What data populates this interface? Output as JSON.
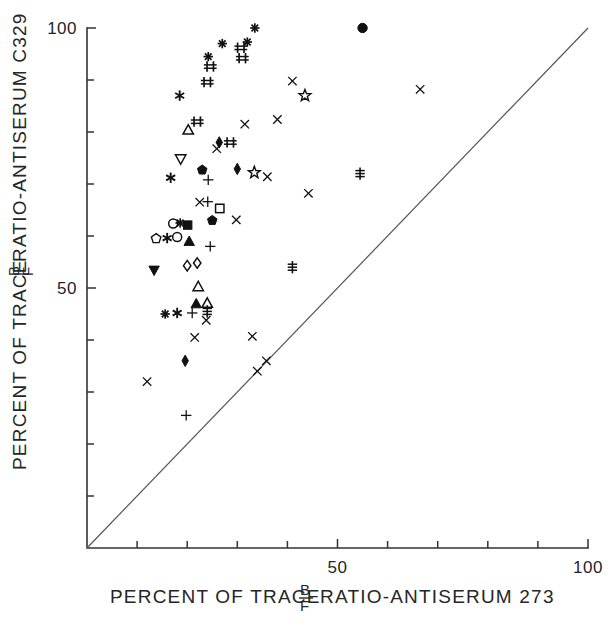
{
  "figure": {
    "width": 610,
    "height": 633,
    "background": "#ffffff",
    "ink_color": "#1a1a1a"
  },
  "chart_data": {
    "type": "scatter",
    "title": "",
    "subtitle": "",
    "xlabel_parts": {
      "prefix": "PERCENT OF TRACE",
      "fraction_numerator": "B",
      "fraction_denominator": "F",
      "suffix": "RATIO-ANTISERUM 273"
    },
    "ylabel_parts": {
      "prefix": "PERCENT OF TRACE",
      "fraction_numerator": "B",
      "fraction_denominator": "F",
      "suffix": "RATIO-ANTISERUM C329"
    },
    "xlabel": "PERCENT OF TRACE B/F RATIO-ANTISERUM 273",
    "ylabel": "PERCENT OF TRACE B/F RATIO-ANTISERUM C329",
    "xlim": [
      0,
      100
    ],
    "ylim": [
      0,
      100
    ],
    "xticks": [
      0,
      10,
      20,
      30,
      40,
      50,
      60,
      70,
      80,
      90,
      100
    ],
    "yticks": [
      0,
      10,
      20,
      30,
      40,
      50,
      60,
      70,
      80,
      90,
      100
    ],
    "xtick_labels": {
      "50": "50",
      "100": "100"
    },
    "ytick_labels": {
      "50": "50",
      "100": "100"
    },
    "grid": false,
    "legend": null,
    "reference_line": {
      "name": "identity-line",
      "from": [
        0,
        0
      ],
      "to": [
        100,
        100
      ],
      "style": "solid",
      "color": "#555555"
    },
    "marker_kinds": [
      "asterisk",
      "plus",
      "cross",
      "double-plus",
      "triple-bar",
      "open-circle",
      "filled-circle",
      "open-square",
      "filled-square",
      "open-triangle-up",
      "filled-triangle-up",
      "open-triangle-down",
      "filled-triangle-down",
      "open-diamond",
      "filled-diamond",
      "open-star",
      "filled-pentagon",
      "open-pentagon",
      "star-burst"
    ],
    "points": [
      {
        "x": 33.5,
        "y": 100.0,
        "marker": "asterisk"
      },
      {
        "x": 55.0,
        "y": 100.0,
        "marker": "filled-circle"
      },
      {
        "x": 27.0,
        "y": 97.0,
        "marker": "asterisk"
      },
      {
        "x": 32.0,
        "y": 97.3,
        "marker": "asterisk"
      },
      {
        "x": 30.7,
        "y": 96.2,
        "marker": "double-plus"
      },
      {
        "x": 24.2,
        "y": 94.5,
        "marker": "asterisk"
      },
      {
        "x": 31.0,
        "y": 94.2,
        "marker": "double-plus"
      },
      {
        "x": 24.6,
        "y": 92.6,
        "marker": "double-plus"
      },
      {
        "x": 24.0,
        "y": 89.6,
        "marker": "double-plus"
      },
      {
        "x": 18.5,
        "y": 87.0,
        "marker": "star-burst"
      },
      {
        "x": 41.0,
        "y": 89.8,
        "marker": "cross"
      },
      {
        "x": 43.5,
        "y": 87.0,
        "marker": "open-star"
      },
      {
        "x": 66.5,
        "y": 88.2,
        "marker": "cross"
      },
      {
        "x": 22.0,
        "y": 82.0,
        "marker": "double-plus"
      },
      {
        "x": 20.2,
        "y": 80.4,
        "marker": "open-triangle-up"
      },
      {
        "x": 31.5,
        "y": 81.5,
        "marker": "cross"
      },
      {
        "x": 38.0,
        "y": 82.4,
        "marker": "cross"
      },
      {
        "x": 26.4,
        "y": 78.0,
        "marker": "filled-diamond"
      },
      {
        "x": 28.6,
        "y": 78.0,
        "marker": "double-plus"
      },
      {
        "x": 25.9,
        "y": 76.8,
        "marker": "cross"
      },
      {
        "x": 18.7,
        "y": 74.8,
        "marker": "open-triangle-down"
      },
      {
        "x": 23.0,
        "y": 72.7,
        "marker": "filled-pentagon"
      },
      {
        "x": 30.0,
        "y": 72.9,
        "marker": "filled-diamond"
      },
      {
        "x": 33.4,
        "y": 72.2,
        "marker": "open-star"
      },
      {
        "x": 16.7,
        "y": 71.2,
        "marker": "star-burst"
      },
      {
        "x": 24.2,
        "y": 70.8,
        "marker": "plus"
      },
      {
        "x": 36.0,
        "y": 71.4,
        "marker": "cross"
      },
      {
        "x": 44.2,
        "y": 68.2,
        "marker": "cross"
      },
      {
        "x": 22.5,
        "y": 66.5,
        "marker": "cross"
      },
      {
        "x": 24.1,
        "y": 66.6,
        "marker": "plus"
      },
      {
        "x": 26.5,
        "y": 65.3,
        "marker": "open-square"
      },
      {
        "x": 25.0,
        "y": 63.0,
        "marker": "filled-pentagon"
      },
      {
        "x": 29.8,
        "y": 63.1,
        "marker": "cross"
      },
      {
        "x": 54.5,
        "y": 72.0,
        "marker": "triple-bar"
      },
      {
        "x": 17.2,
        "y": 62.4,
        "marker": "open-circle"
      },
      {
        "x": 18.6,
        "y": 62.5,
        "marker": "asterisk"
      },
      {
        "x": 20.1,
        "y": 62.1,
        "marker": "filled-square"
      },
      {
        "x": 13.8,
        "y": 59.5,
        "marker": "open-pentagon"
      },
      {
        "x": 16.0,
        "y": 59.6,
        "marker": "star-burst"
      },
      {
        "x": 18.0,
        "y": 59.8,
        "marker": "open-circle"
      },
      {
        "x": 20.4,
        "y": 59.0,
        "marker": "filled-triangle-up"
      },
      {
        "x": 24.6,
        "y": 58.0,
        "marker": "plus"
      },
      {
        "x": 20.0,
        "y": 54.3,
        "marker": "open-diamond"
      },
      {
        "x": 22.0,
        "y": 54.8,
        "marker": "open-diamond"
      },
      {
        "x": 13.4,
        "y": 53.4,
        "marker": "filled-triangle-down"
      },
      {
        "x": 41.0,
        "y": 54.0,
        "marker": "triple-bar"
      },
      {
        "x": 22.2,
        "y": 50.3,
        "marker": "open-triangle-up"
      },
      {
        "x": 21.8,
        "y": 47.0,
        "marker": "filled-triangle-up"
      },
      {
        "x": 24.0,
        "y": 47.1,
        "marker": "open-triangle-up"
      },
      {
        "x": 15.6,
        "y": 45.0,
        "marker": "asterisk"
      },
      {
        "x": 18.0,
        "y": 45.2,
        "marker": "star-burst"
      },
      {
        "x": 21.0,
        "y": 45.2,
        "marker": "plus"
      },
      {
        "x": 24.0,
        "y": 45.5,
        "marker": "triple-bar"
      },
      {
        "x": 23.8,
        "y": 43.8,
        "marker": "cross"
      },
      {
        "x": 21.5,
        "y": 40.5,
        "marker": "cross"
      },
      {
        "x": 33.0,
        "y": 40.7,
        "marker": "cross"
      },
      {
        "x": 35.8,
        "y": 36.0,
        "marker": "cross"
      },
      {
        "x": 19.6,
        "y": 36.0,
        "marker": "filled-diamond"
      },
      {
        "x": 34.0,
        "y": 34.0,
        "marker": "cross"
      },
      {
        "x": 12.0,
        "y": 32.0,
        "marker": "cross"
      },
      {
        "x": 19.8,
        "y": 25.5,
        "marker": "plus"
      }
    ]
  }
}
